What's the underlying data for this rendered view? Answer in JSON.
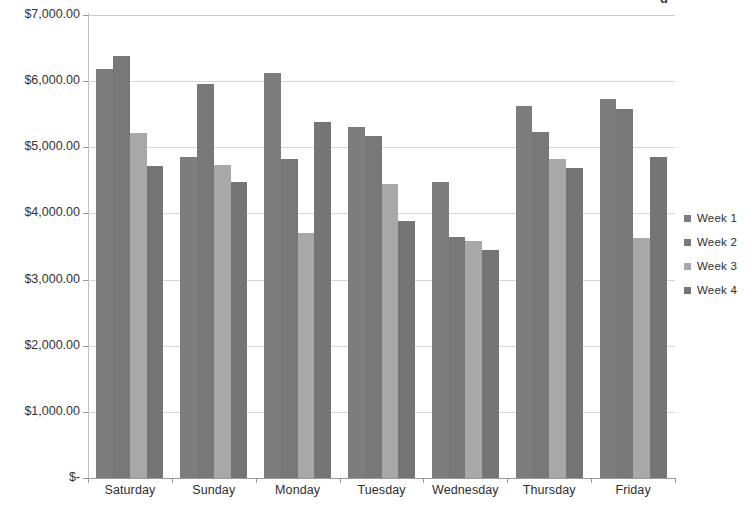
{
  "chart_data": {
    "type": "bar",
    "title": "",
    "xlabel": "",
    "ylabel": "",
    "ylim": [
      0,
      7000
    ],
    "ytick_labels": [
      "$7,000.00",
      "$6,000.00",
      "$5,000.00",
      "$4,000.00",
      "$3,000.00",
      "$2,000.00",
      "$1,000.00",
      "$-"
    ],
    "ytick_values": [
      7000,
      6000,
      5000,
      4000,
      3000,
      2000,
      1000,
      0
    ],
    "grid": true,
    "legend_position": "right",
    "categories": [
      "Saturday",
      "Sunday",
      "Monday",
      "Tuesday",
      "Wednesday",
      "Thursday",
      "Friday"
    ],
    "series": [
      {
        "name": "Week 1",
        "color": "#7d7d7d",
        "values": [
          6180,
          4850,
          6130,
          5300,
          4470,
          5630,
          5730
        ]
      },
      {
        "name": "Week 2",
        "color": "#787878",
        "values": [
          6380,
          5960,
          4820,
          5170,
          3650,
          5230,
          5580
        ]
      },
      {
        "name": "Week 3",
        "color": "#a8a8a8",
        "values": [
          5220,
          4730,
          3710,
          4450,
          3590,
          4820,
          3630
        ]
      },
      {
        "name": "Week 4",
        "color": "#757575",
        "values": [
          4710,
          4470,
          5390,
          3880,
          3440,
          4690,
          4850
        ]
      }
    ]
  },
  "title_remnant": "g",
  "colors": {
    "gridline": "#d6d6d6",
    "axis": "#9a9a9a",
    "text": "#2e2e2e",
    "background": "#ffffff"
  }
}
